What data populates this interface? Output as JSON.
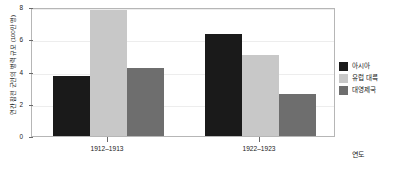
{
  "chart_data": {
    "type": "bar",
    "title": "",
    "xlabel": "연도",
    "ylabel": "연간 참전 군인의 병력 규모 (100만 명)",
    "categories": [
      "1912–1913",
      "1922–1923"
    ],
    "series": [
      {
        "name": "아시아",
        "color": "#1a1a1a",
        "values": [
          3.7,
          6.3
        ]
      },
      {
        "name": "유럽 대륙",
        "color": "#c8c8c8",
        "values": [
          7.8,
          5.0
        ]
      },
      {
        "name": "대영제국",
        "color": "#6e6e6e",
        "values": [
          4.2,
          2.6
        ]
      }
    ],
    "ylim": [
      0,
      8
    ],
    "yticks": [
      0,
      2,
      4,
      6,
      8
    ],
    "ytick_labels": [
      "0",
      "2",
      "4",
      "6",
      "8"
    ],
    "grid": true,
    "legend_position": "right"
  },
  "legend": {
    "items": [
      {
        "label": "아시아",
        "color": "#1a1a1a"
      },
      {
        "label": "유럽 대륙",
        "color": "#c8c8c8"
      },
      {
        "label": "대영제국",
        "color": "#6e6e6e"
      }
    ]
  },
  "axes": {
    "y_title": "연간 참전 군인의 병력 규모 (100만 명)",
    "x_title": "연도",
    "y_tick_labels": [
      "0",
      "2",
      "4",
      "6",
      "8"
    ],
    "x_tick_labels": [
      "1912–1913",
      "1922–1923"
    ]
  }
}
